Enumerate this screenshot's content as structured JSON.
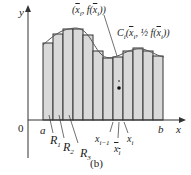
{
  "figure": {
    "caption": "(b)",
    "axis_x_label": "x",
    "axis_y_label": "y",
    "origin_label": "0",
    "a_label": "a",
    "b_label": "b",
    "region_labels": [
      "R1",
      "R2",
      "R3"
    ],
    "xi_minus_1_label": "x i−1",
    "xi_label": "x i",
    "xbar_label": "x̄ i",
    "top_point_label": "(x̄i, f(x̄i))",
    "centroid_label": "Ci(x̄i, ½ f(x̄i))"
  },
  "colors": {
    "fill": "#d9d9d9",
    "stroke": "#333333",
    "curve": "#555555"
  }
}
